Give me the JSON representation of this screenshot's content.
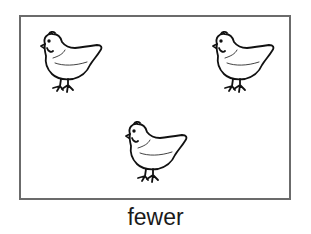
{
  "card": {
    "caption": "fewer",
    "border_color": "#6b6b6b",
    "items": [
      {
        "icon": "hen-icon",
        "x": 35,
        "y": 30
      },
      {
        "icon": "hen-icon",
        "x": 207,
        "y": 30
      },
      {
        "icon": "hen-icon",
        "x": 120,
        "y": 120
      }
    ],
    "count": 3
  }
}
